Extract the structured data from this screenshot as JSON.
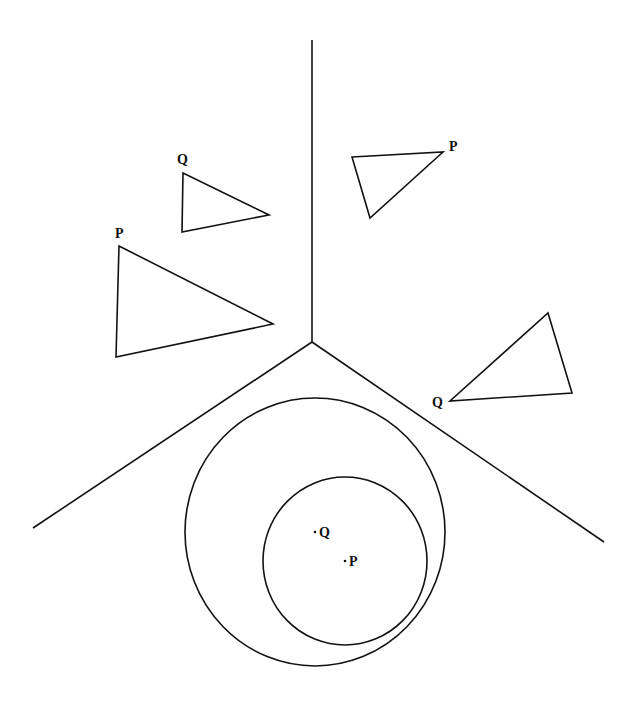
{
  "diagram": {
    "labels": {
      "tri_upper_left_small_Q": "Q",
      "tri_upper_left_large_P": "P",
      "tri_upper_right_P": "P",
      "tri_right_Q": "Q",
      "circle_point_Q": "Q",
      "circle_point_P": "P"
    },
    "colors": {
      "stroke": "#111111",
      "background": "#ffffff"
    }
  }
}
